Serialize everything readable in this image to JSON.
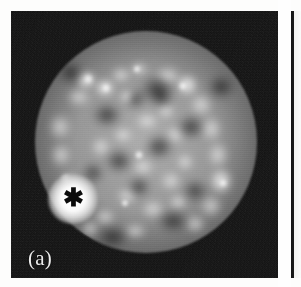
{
  "figure": {
    "modality_description": "grayscale tomographic uptake image",
    "panel_label": "(a)",
    "marker_glyph": "✱",
    "marker_meaning": "focal hot lesion",
    "colors": {
      "background": "#fdfdfc",
      "field_black": "#0c0c0c",
      "tissue_gray": "#9a9a9a",
      "lesion_white": "#ffffff",
      "label_white": "#ededed",
      "marker_black": "#0b0b0b"
    },
    "panel": {
      "x": 11,
      "y": 11,
      "width": 267,
      "height": 267
    },
    "lesion_marker": {
      "center_x": 61,
      "center_y": 187
    },
    "adjacent_panel": {
      "visible": "edge sliver",
      "x": 291
    }
  },
  "image_content": {
    "structures": [
      {
        "name": "outer-body-contour",
        "description": "faint circular rim arc around the organ"
      },
      {
        "name": "organ-disc",
        "description": "round speckled uptake field filling the panel"
      },
      {
        "name": "hot-lesion",
        "description": "bright focal hotspot at lower left marked by an asterisk"
      },
      {
        "name": "bright-rim-arc-right",
        "description": "curved band of increased uptake along the right margin"
      },
      {
        "name": "bright-cluster-upper-left",
        "description": "cluster of bright foci in the upper left quadrant"
      },
      {
        "name": "photopenic-center",
        "description": "darker low-uptake region near the centre"
      },
      {
        "name": "small-focus-center",
        "description": "small bright dot just left of centre"
      },
      {
        "name": "small-focus-lower-right",
        "description": "small bright dot in the lower right quadrant"
      }
    ]
  }
}
